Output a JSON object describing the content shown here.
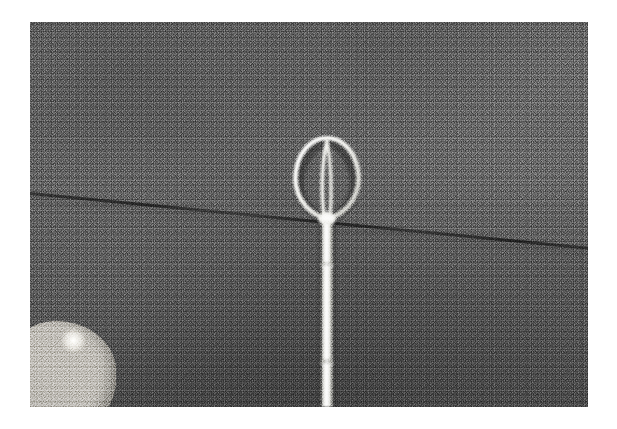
{
  "page": {
    "background_color": "#ffffff",
    "width": 617,
    "height": 429
  },
  "photograph": {
    "name": "surgical-snare-instrument-photo",
    "kind": "photograph",
    "color_mode": "grayscale",
    "frame": {
      "x": 30,
      "y": 22,
      "width": 558,
      "height": 385
    },
    "border_color": "#ffffff",
    "caption": "",
    "grain": "heavy film grain"
  },
  "background": {
    "subject": "woven fabric cloth",
    "tone_top": "#5f5f5f",
    "tone_middle": "#565656",
    "tone_bottom": "#484848",
    "texture": "dense woven weave",
    "seam": {
      "name": "diagonal-seam-line",
      "color": "#1a1a1a",
      "angle_degrees": 5.6,
      "description": "dark stitched seam running left to right, sloping downward"
    }
  },
  "instrument": {
    "name": "wire-loop-snare",
    "material_color": "#f2f2ee",
    "shadow_color": "#8d8d88",
    "shaft": {
      "name": "instrument-shaft",
      "center_x": 297,
      "top_y": 193,
      "bottom_y": 385,
      "width": 11,
      "joints_y": [
        243,
        340
      ],
      "description": "bright metallic cylindrical shaft with two segment joints"
    },
    "loop": {
      "name": "wire-loop-head",
      "top_y": 116,
      "bottom_y": 196,
      "left_x": 264,
      "right_x": 332,
      "wire_thickness": 4,
      "shape": "inverted teardrop / balloon",
      "inner_wires": {
        "name": "inner-wire-pair",
        "count": 2,
        "shape": "narrow vertical lens",
        "width": 9
      }
    }
  },
  "foreground_object": {
    "name": "knitted-textile-object",
    "position": "bottom-left-corner",
    "color_light": "#fbfbf8",
    "color_mid": "#d9d7d0",
    "color_shadow": "#a3a099",
    "description": "white knitted or crocheted textured fabric bundle"
  }
}
